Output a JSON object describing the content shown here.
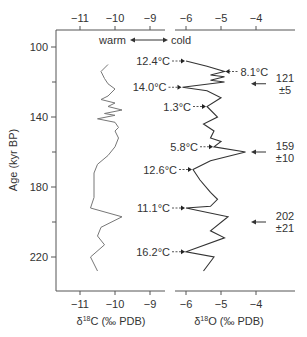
{
  "chart_data": [
    {
      "type": "line",
      "title": "",
      "xlabel": "δ18C (‰ PDB)",
      "xlabel_main": "δ",
      "xlabel_sup": "18",
      "xlabel_rest": "C (‰ PDB)",
      "ylabel": "Age (kyr BP)",
      "xlim": [
        -11.7,
        -8.6
      ],
      "ylim": [
        100,
        233
      ],
      "x_ticks": [
        -11,
        -10,
        -9
      ],
      "x_tick_labels": [
        "−11",
        "−10",
        "−9"
      ],
      "y_ticks": [
        100,
        140,
        180,
        220
      ],
      "y_minor_ticks": [
        120,
        160,
        200
      ],
      "grid": false,
      "series": [
        {
          "name": "δ18C",
          "color": "#777777",
          "points": [
            [
              -10.2,
              110
            ],
            [
              -10.4,
              114
            ],
            [
              -10.3,
              118
            ],
            [
              -10.2,
              121
            ],
            [
              -10.0,
              124
            ],
            [
              -10.2,
              128
            ],
            [
              -10.4,
              130
            ],
            [
              -10.0,
              132
            ],
            [
              -10.2,
              134
            ],
            [
              -9.8,
              136
            ],
            [
              -10.3,
              138
            ],
            [
              -10.0,
              139
            ],
            [
              -10.5,
              141
            ],
            [
              -10.0,
              143
            ],
            [
              -9.9,
              146
            ],
            [
              -10.0,
              148
            ],
            [
              -9.9,
              152
            ],
            [
              -10.0,
              157
            ],
            [
              -10.2,
              162
            ],
            [
              -10.5,
              167
            ],
            [
              -10.6,
              172
            ],
            [
              -10.6,
              180
            ],
            [
              -10.6,
              186
            ],
            [
              -10.7,
              192
            ],
            [
              -9.8,
              197
            ],
            [
              -10.4,
              203
            ],
            [
              -10.5,
              208
            ],
            [
              -10.3,
              213
            ],
            [
              -10.7,
              220
            ],
            [
              -10.5,
              228
            ]
          ]
        }
      ]
    },
    {
      "type": "line",
      "title": "",
      "xlabel": "δ18O (‰ PDB)",
      "xlabel_main": "δ",
      "xlabel_sup": "18",
      "xlabel_rest": "O (‰ PDB)",
      "xlim": [
        -6.3,
        -2.9
      ],
      "ylim": [
        100,
        233
      ],
      "x_ticks": [
        -6,
        -5,
        -4
      ],
      "x_tick_labels": [
        "−6",
        "−5",
        "−4"
      ],
      "grid": false,
      "series": [
        {
          "name": "δ18O",
          "color": "#333333",
          "points": [
            [
              -6.0,
              108
            ],
            [
              -5.4,
              111
            ],
            [
              -4.9,
              114
            ],
            [
              -5.3,
              116
            ],
            [
              -4.9,
              117
            ],
            [
              -5.3,
              119
            ],
            [
              -4.9,
              120
            ],
            [
              -6.1,
              123
            ],
            [
              -5.4,
              125
            ],
            [
              -5.0,
              129
            ],
            [
              -5.4,
              134
            ],
            [
              -5.1,
              140
            ],
            [
              -5.5,
              144
            ],
            [
              -5.2,
              148
            ],
            [
              -5.3,
              152
            ],
            [
              -5.0,
              154
            ],
            [
              -5.2,
              157
            ],
            [
              -4.3,
              160
            ],
            [
              -5.3,
              165
            ],
            [
              -5.8,
              170
            ],
            [
              -5.6,
              176
            ],
            [
              -5.3,
              183
            ],
            [
              -5.1,
              187
            ],
            [
              -5.3,
              191
            ],
            [
              -6.0,
              192
            ],
            [
              -4.8,
              197
            ],
            [
              -5.3,
              205
            ],
            [
              -4.9,
              209
            ],
            [
              -6.0,
              217
            ],
            [
              -5.2,
              220
            ],
            [
              -5.5,
              228
            ]
          ]
        }
      ],
      "annotations": [
        {
          "label": "12.4°C",
          "x": -6.0,
          "y": 108
        },
        {
          "label": "8.1°C",
          "x": -4.9,
          "y": 114,
          "side": "right"
        },
        {
          "label": "14.0°C",
          "x": -6.1,
          "y": 123
        },
        {
          "label": "1.3°C",
          "x": -5.4,
          "y": 134
        },
        {
          "label": "5.8°C",
          "x": -5.2,
          "y": 157
        },
        {
          "label": "12.6°C",
          "x": -5.8,
          "y": 170
        },
        {
          "label": "11.1°C",
          "x": -6.0,
          "y": 192
        },
        {
          "label": "16.2°C",
          "x": -6.0,
          "y": 217
        }
      ],
      "age_markers": [
        {
          "value": "121",
          "error": "±5",
          "y": 121
        },
        {
          "value": "159",
          "error": "±10",
          "y": 160
        },
        {
          "value": "202",
          "error": "±21",
          "y": 200
        }
      ]
    }
  ],
  "legend_arrow": {
    "left": "warm",
    "right": "cold"
  }
}
